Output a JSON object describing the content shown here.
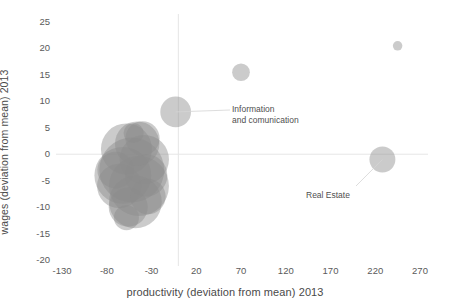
{
  "chart_data": {
    "type": "scatter",
    "title": "",
    "subtitle": "",
    "xlabel": "productivity (deviation from mean) 2013",
    "ylabel": "wages (deviation from mean) 2013",
    "xlim": [
      -130,
      270
    ],
    "ylim": [
      -20,
      25
    ],
    "xticks": [
      -130,
      -80,
      -30,
      20,
      70,
      120,
      170,
      220,
      270
    ],
    "yticks": [
      25,
      20,
      15,
      10,
      5,
      0,
      -5,
      -10,
      -15,
      -20
    ],
    "grid": false,
    "zero_lines": {
      "x": 0,
      "y": 0,
      "color": "#e6e6e6"
    },
    "legend": "none",
    "bubble_color": "#8c8c8c",
    "bubble_opacity": 0.45,
    "points": [
      {
        "label": "sector-a",
        "x": -62,
        "y": -4,
        "size": 72
      },
      {
        "label": "sector-b",
        "x": -52,
        "y": -3,
        "size": 94
      },
      {
        "label": "sector-c",
        "x": -44,
        "y": -6,
        "size": 80
      },
      {
        "label": "sector-d",
        "x": -58,
        "y": 1,
        "size": 58
      },
      {
        "label": "sector-e",
        "x": -38,
        "y": -1,
        "size": 54
      },
      {
        "label": "sector-f",
        "x": -66,
        "y": -6,
        "size": 44
      },
      {
        "label": "sector-g",
        "x": -48,
        "y": -9,
        "size": 62
      },
      {
        "label": "sector-h",
        "x": -56,
        "y": -10,
        "size": 34
      },
      {
        "label": "sector-i",
        "x": -36,
        "y": -4,
        "size": 40
      },
      {
        "label": "sector-j",
        "x": -46,
        "y": 2,
        "size": 44
      },
      {
        "label": "sector-k",
        "x": -70,
        "y": -3,
        "size": 30
      },
      {
        "label": "sector-l",
        "x": -40,
        "y": 3,
        "size": 26
      },
      {
        "label": "sector-m",
        "x": -50,
        "y": 4,
        "size": 9
      },
      {
        "label": "sector-n",
        "x": -34,
        "y": -8,
        "size": 28
      },
      {
        "label": "sector-o",
        "x": -58,
        "y": -12,
        "size": 14
      },
      {
        "label": "Information and comunication",
        "x": -3,
        "y": 8,
        "size": 21
      },
      {
        "label": "unlabelled-high-wage",
        "x": 70,
        "y": 15.5,
        "size": 7
      },
      {
        "label": "Real Estate",
        "x": 228,
        "y": -1,
        "size": 15
      },
      {
        "label": "unlabelled-top-right",
        "x": 245,
        "y": 20.5,
        "size": 2
      }
    ],
    "annotations": [
      {
        "name": "information-and-comunication",
        "line1": "Information",
        "line2": "and comunication",
        "points_to": {
          "x": -3,
          "y": 8
        }
      },
      {
        "name": "real-estate",
        "line1": "Real Estate",
        "line2": "",
        "points_to": {
          "x": 228,
          "y": -1
        }
      }
    ]
  },
  "axes": {
    "y_title": "wages (deviation from mean) 2013",
    "x_title": "productivity (deviation from mean) 2013",
    "y_ticks": [
      "25",
      "20",
      "15",
      "10",
      "5",
      "0",
      "-5",
      "-10",
      "-15",
      "-20"
    ],
    "x_ticks": [
      "-130",
      "-80",
      "-30",
      "20",
      "70",
      "120",
      "170",
      "220",
      "270"
    ]
  },
  "annotations": {
    "info": {
      "line1": "Information",
      "line2": "and comunication"
    },
    "real_estate": {
      "line1": "Real Estate"
    }
  }
}
